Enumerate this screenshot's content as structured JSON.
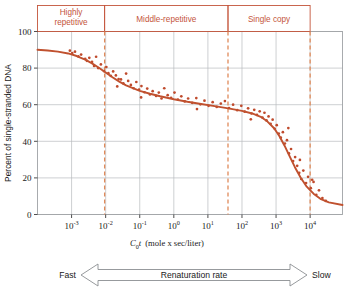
{
  "chart_data": {
    "type": "scatter",
    "title": "",
    "xlabel": "C0t  (mole x sec/liter)",
    "xlabel_parts": {
      "c": "C",
      "zero": "0",
      "t": "t",
      "units": "(mole x sec/liter)"
    },
    "ylabel": "Percent of single-stranded DNA",
    "xscale": "log",
    "xlim": [
      -4.0,
      4.95
    ],
    "ylim": [
      0,
      100
    ],
    "grid": true,
    "legend": false,
    "x_tick_labels": [
      "10-3",
      "10-2",
      "10-1",
      "100",
      "101",
      "102",
      "103",
      "104"
    ],
    "x_tick_mantissa": [
      "10",
      "10",
      "10",
      "10",
      "10",
      "10",
      "10",
      "10"
    ],
    "x_tick_exponents": [
      "-3",
      "-2",
      "-1",
      "0",
      "1",
      "2",
      "3",
      "4"
    ],
    "x_tick_values": [
      -3,
      -2,
      -1,
      0,
      1,
      2,
      3,
      4
    ],
    "y_tick_labels": [
      "0",
      "20",
      "40",
      "60",
      "80",
      "100"
    ],
    "y_tick_values": [
      0,
      20,
      40,
      60,
      80,
      100
    ],
    "curve_color": "#c0512f",
    "point_color": "#bf4a2c",
    "grid_color": "#b9bcbe",
    "frame_color": "#9fa3a6",
    "fit_curve": [
      [
        -4.0,
        90.0
      ],
      [
        -3.7,
        89.6
      ],
      [
        -3.4,
        89.0
      ],
      [
        -3.1,
        88.0
      ],
      [
        -2.85,
        86.6
      ],
      [
        -2.6,
        84.6
      ],
      [
        -2.4,
        82.6
      ],
      [
        -2.2,
        80.2
      ],
      [
        -2.0,
        77.6
      ],
      [
        -1.8,
        75.0
      ],
      [
        -1.6,
        72.6
      ],
      [
        -1.4,
        70.6
      ],
      [
        -1.2,
        69.0
      ],
      [
        -1.0,
        67.6
      ],
      [
        -0.7,
        66.0
      ],
      [
        -0.4,
        64.6
      ],
      [
        0.0,
        63.0
      ],
      [
        0.4,
        61.6
      ],
      [
        0.8,
        60.4
      ],
      [
        1.2,
        59.2
      ],
      [
        1.6,
        58.0
      ],
      [
        2.0,
        56.6
      ],
      [
        2.3,
        55.2
      ],
      [
        2.55,
        53.4
      ],
      [
        2.75,
        50.8
      ],
      [
        2.95,
        47.0
      ],
      [
        3.1,
        42.8
      ],
      [
        3.25,
        37.6
      ],
      [
        3.4,
        31.8
      ],
      [
        3.55,
        26.0
      ],
      [
        3.72,
        20.2
      ],
      [
        3.9,
        15.2
      ],
      [
        4.1,
        11.4
      ],
      [
        4.3,
        8.6
      ],
      [
        4.55,
        6.6
      ],
      [
        4.95,
        5.2
      ]
    ],
    "points": [
      [
        -3.05,
        89.5
      ],
      [
        -2.98,
        88.2
      ],
      [
        -2.9,
        89.0
      ],
      [
        -2.8,
        86.4
      ],
      [
        -2.72,
        87.4
      ],
      [
        -2.6,
        85.0
      ],
      [
        -2.55,
        84.0
      ],
      [
        -2.48,
        85.6
      ],
      [
        -2.4,
        83.4
      ],
      [
        -2.34,
        81.2
      ],
      [
        -2.28,
        86.2
      ],
      [
        -2.22,
        80.0
      ],
      [
        -2.14,
        82.0
      ],
      [
        -2.05,
        78.4
      ],
      [
        -1.98,
        80.6
      ],
      [
        -1.92,
        77.2
      ],
      [
        -1.85,
        75.8
      ],
      [
        -1.78,
        78.2
      ],
      [
        -1.7,
        76.0
      ],
      [
        -1.62,
        74.0
      ],
      [
        -1.55,
        73.8
      ],
      [
        -1.48,
        71.6
      ],
      [
        -1.4,
        77.0
      ],
      [
        -1.34,
        73.0
      ],
      [
        -1.26,
        70.8
      ],
      [
        -1.18,
        69.0
      ],
      [
        -1.1,
        72.4
      ],
      [
        -1.02,
        68.2
      ],
      [
        -0.95,
        70.2
      ],
      [
        -0.86,
        66.8
      ],
      [
        -0.78,
        68.8
      ],
      [
        -0.7,
        65.6
      ],
      [
        -0.62,
        67.4
      ],
      [
        -0.52,
        64.8
      ],
      [
        -0.44,
        66.6
      ],
      [
        -0.36,
        63.4
      ],
      [
        -0.28,
        69.0
      ],
      [
        -0.18,
        65.2
      ],
      [
        -0.08,
        63.8
      ],
      [
        0.02,
        66.6
      ],
      [
        0.12,
        62.8
      ],
      [
        0.22,
        64.6
      ],
      [
        0.32,
        61.8
      ],
      [
        0.42,
        63.4
      ],
      [
        0.54,
        61.0
      ],
      [
        0.66,
        63.6
      ],
      [
        0.78,
        60.2
      ],
      [
        0.9,
        62.2
      ],
      [
        1.02,
        59.4
      ],
      [
        1.14,
        61.4
      ],
      [
        1.26,
        58.8
      ],
      [
        1.38,
        60.6
      ],
      [
        1.5,
        62.0
      ],
      [
        1.62,
        58.2
      ],
      [
        1.74,
        60.0
      ],
      [
        1.86,
        57.0
      ],
      [
        1.98,
        59.4
      ],
      [
        2.08,
        56.2
      ],
      [
        2.18,
        58.0
      ],
      [
        2.28,
        55.2
      ],
      [
        2.36,
        57.2
      ],
      [
        2.44,
        54.4
      ],
      [
        2.52,
        56.4
      ],
      [
        2.6,
        53.0
      ],
      [
        2.66,
        55.6
      ],
      [
        2.72,
        51.4
      ],
      [
        2.78,
        53.6
      ],
      [
        2.84,
        49.6
      ],
      [
        2.9,
        51.8
      ],
      [
        2.96,
        46.8
      ],
      [
        3.02,
        48.8
      ],
      [
        3.08,
        44.2
      ],
      [
        3.14,
        42.0
      ],
      [
        3.2,
        45.0
      ],
      [
        3.26,
        38.8
      ],
      [
        3.32,
        40.6
      ],
      [
        3.38,
        33.4
      ],
      [
        3.44,
        35.8
      ],
      [
        3.5,
        29.2
      ],
      [
        3.56,
        31.4
      ],
      [
        3.62,
        26.6
      ],
      [
        3.68,
        22.8
      ],
      [
        3.74,
        19.4
      ],
      [
        3.8,
        24.0
      ],
      [
        3.88,
        17.2
      ],
      [
        3.94,
        20.6
      ],
      [
        4.02,
        14.4
      ],
      [
        4.1,
        17.8
      ],
      [
        4.18,
        10.8
      ],
      [
        4.26,
        13.2
      ],
      [
        4.36,
        9.0
      ],
      [
        4.46,
        7.4
      ],
      [
        -1.66,
        70.0
      ],
      [
        -0.96,
        64.0
      ],
      [
        0.68,
        57.6
      ],
      [
        2.26,
        52.0
      ],
      [
        3.36,
        47.2
      ],
      [
        3.7,
        29.8
      ],
      [
        4.06,
        19.0
      ]
    ],
    "categories": [
      {
        "id": "highly-repetitive",
        "label": "Highly repetitive",
        "label_line1": "Highly",
        "label_line2": "repetitive",
        "x_start": -4.0,
        "x_end": -2.03
      },
      {
        "id": "middle-repetitive",
        "label": "Middle-repetitive",
        "label_line1": "Middle-repetitive",
        "label_line2": "",
        "x_start": -2.03,
        "x_end": 1.59
      },
      {
        "id": "single-copy",
        "label": "Single copy",
        "label_line1": "Single copy",
        "label_line2": "",
        "x_start": 1.59,
        "x_end": 4.0
      }
    ],
    "divider_lines": [
      -2.03,
      1.59,
      4.0
    ],
    "annotation_arrow": {
      "left_label": "Fast",
      "center_label": "Renaturation rate",
      "right_label": "Slow",
      "stroke_color": "#8b8f92"
    }
  }
}
